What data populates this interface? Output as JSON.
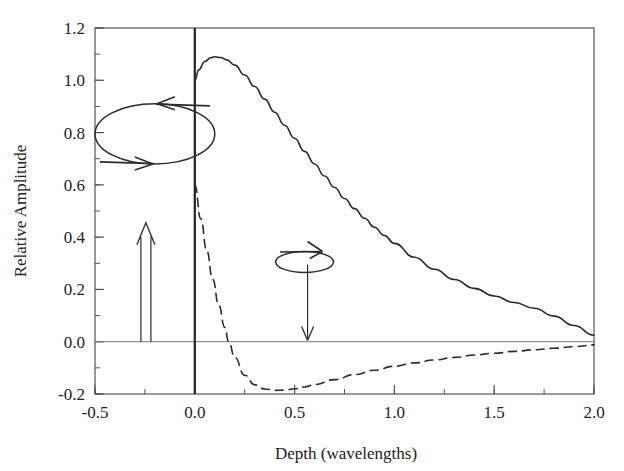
{
  "figure": {
    "background_color": "#ffffff",
    "line_color": "#2b2b2b",
    "frame_color": "#555555"
  },
  "chart_data": {
    "type": "line",
    "title": "",
    "xlabel": "Depth (wavelengths)",
    "ylabel": "Relative Amplitude",
    "xlim": [
      -0.5,
      2.0
    ],
    "ylim": [
      -0.2,
      1.2
    ],
    "grid": false,
    "legend": "none",
    "xticks": [
      -0.5,
      0.0,
      0.5,
      1.0,
      1.5,
      2.0
    ],
    "xtick_labels": [
      "-0.5",
      "0.0",
      "0.5",
      "1.0",
      "1.5",
      "2.0"
    ],
    "xminor_step": 0.25,
    "yticks": [
      -0.2,
      0.0,
      0.2,
      0.4,
      0.6,
      0.8,
      1.0,
      1.2
    ],
    "ytick_labels": [
      "-0.2",
      "0.0",
      "0.2",
      "0.4",
      "0.6",
      "0.8",
      "1.0",
      "1.2"
    ],
    "yminor_step": 0.1,
    "zero_line_y": 0.0,
    "vertical_line_x": 0.0,
    "series": [
      {
        "name": "vertical-component",
        "style": "solid",
        "x": [
          0.0,
          0.02,
          0.05,
          0.08,
          0.1,
          0.13,
          0.16,
          0.2,
          0.25,
          0.3,
          0.35,
          0.4,
          0.45,
          0.5,
          0.55,
          0.6,
          0.65,
          0.7,
          0.75,
          0.8,
          0.85,
          0.9,
          0.95,
          1.0,
          1.1,
          1.2,
          1.3,
          1.4,
          1.5,
          1.6,
          1.7,
          1.8,
          1.9,
          2.0
        ],
        "y": [
          1.0,
          1.04,
          1.072,
          1.086,
          1.09,
          1.087,
          1.078,
          1.058,
          1.02,
          0.976,
          0.928,
          0.878,
          0.828,
          0.778,
          0.728,
          0.68,
          0.634,
          0.59,
          0.548,
          0.509,
          0.472,
          0.438,
          0.406,
          0.376,
          0.323,
          0.277,
          0.238,
          0.204,
          0.175,
          0.15,
          0.128,
          0.098,
          0.062,
          0.025
        ]
      },
      {
        "name": "horizontal-component",
        "style": "dashed",
        "x": [
          0.0,
          0.03,
          0.06,
          0.09,
          0.12,
          0.15,
          0.17,
          0.2,
          0.25,
          0.3,
          0.35,
          0.4,
          0.45,
          0.5,
          0.55,
          0.6,
          0.7,
          0.8,
          0.9,
          1.0,
          1.1,
          1.2,
          1.3,
          1.4,
          1.5,
          1.6,
          1.7,
          1.8,
          1.9,
          2.0
        ],
        "y": [
          0.6,
          0.47,
          0.348,
          0.238,
          0.14,
          0.055,
          0.0,
          -0.06,
          -0.128,
          -0.165,
          -0.181,
          -0.186,
          -0.185,
          -0.18,
          -0.173,
          -0.164,
          -0.145,
          -0.126,
          -0.109,
          -0.094,
          -0.081,
          -0.07,
          -0.06,
          -0.051,
          -0.044,
          -0.037,
          -0.031,
          -0.025,
          -0.019,
          -0.012
        ]
      }
    ],
    "annotations": [
      {
        "name": "retrograde-ellipse",
        "kind": "ellipse-with-arrows",
        "center_x": -0.2,
        "center_y": 0.795,
        "rx": 0.3,
        "ry": 0.115,
        "arrow_top_direction": "left",
        "arrow_bottom_direction": "right"
      },
      {
        "name": "vertical-motion-arrow",
        "kind": "double-shaft-up-arrow",
        "x": -0.245,
        "y_start": 0.0,
        "y_end": 0.455
      },
      {
        "name": "prograde-ellipse",
        "kind": "flat-ellipse-with-arrow",
        "center_x": 0.55,
        "center_y": 0.305,
        "rx": 0.145,
        "ry": 0.04,
        "arrow_direction": "right"
      },
      {
        "name": "downward-propagation-arrow",
        "kind": "down-arrow",
        "x": 0.565,
        "y_start": 0.295,
        "y_end": 0.005
      }
    ]
  }
}
